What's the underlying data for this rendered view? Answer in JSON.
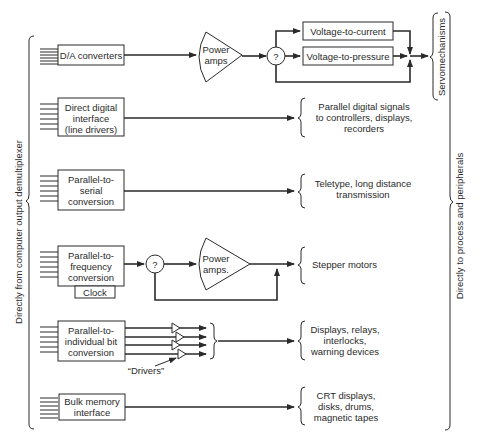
{
  "diagram": {
    "left_label": "Directly from computer output demultiplexer",
    "right_label": "Directly to process and peripherals",
    "servo_label": "Servomechanisms",
    "rows": [
      {
        "source_lines": [
          "D/A converters"
        ],
        "power_amps": [
          "Power",
          "amps"
        ],
        "decision": "?",
        "branches": [
          "Voltage-to-current",
          "Voltage-to-pressure"
        ]
      },
      {
        "source_lines": [
          "Direct digital",
          "interface",
          "(line drivers)"
        ],
        "target_lines": [
          "Parallel digital signals",
          "to controllers, displays,",
          "recorders"
        ]
      },
      {
        "source_lines": [
          "Parallel-to-",
          "serial",
          "conversion"
        ],
        "target_lines": [
          "Teletype, long distance",
          "transmission"
        ]
      },
      {
        "source_lines": [
          "Parallel-to-",
          "frequency",
          "conversion"
        ],
        "clock": "Clock",
        "decision": "?",
        "power_amps": [
          "Power",
          "amps."
        ],
        "target_lines": [
          "Stepper motors"
        ]
      },
      {
        "source_lines": [
          "Parallel-to-",
          "individual bit",
          "conversion"
        ],
        "drivers_label": "“Drivers”",
        "target_lines": [
          "Displays, relays,",
          "interlocks,",
          "warning devices"
        ]
      },
      {
        "source_lines": [
          "Bulk memory",
          "interface"
        ],
        "target_lines": [
          "CRT displays,",
          "disks, drums,",
          "magnetic tapes"
        ]
      }
    ]
  }
}
